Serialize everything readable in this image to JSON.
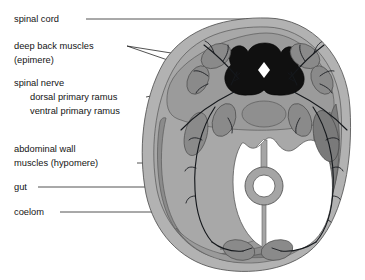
{
  "figure": {
    "background_color": "#ffffff",
    "width": 365,
    "height": 280
  },
  "labels": [
    {
      "id": "spinal-cord",
      "text": "spinal cord",
      "x": 14,
      "y": 22
    },
    {
      "id": "deep-back-muscles",
      "text": "deep back muscles",
      "x": 14,
      "y": 49
    },
    {
      "id": "epimere",
      "text": "(epimere)",
      "x": 14,
      "y": 63
    },
    {
      "id": "spinal-nerve",
      "text": "spinal nerve",
      "x": 14,
      "y": 86
    },
    {
      "id": "dorsal-primary-ramus",
      "text": "dorsal primary ramus",
      "x": 30,
      "y": 100
    },
    {
      "id": "ventral-primary-ramus",
      "text": "ventral primary ramus",
      "x": 30,
      "y": 114
    },
    {
      "id": "abdominal-wall-muscles",
      "text": "abdominal wall",
      "x": 14,
      "y": 152
    },
    {
      "id": "hypomere",
      "text": "muscles (hypomere)",
      "x": 14,
      "y": 166
    },
    {
      "id": "gut",
      "text": "gut",
      "x": 14,
      "y": 190
    },
    {
      "id": "coelom",
      "text": "coelom",
      "x": 14,
      "y": 215
    }
  ],
  "structures": {
    "body_wall": {
      "name": "outer body wall",
      "color": "#b2b2b2"
    },
    "somatic_layer": {
      "name": "somatic mesoderm layer",
      "color": "#a8a8a8"
    },
    "epimere_field": {
      "name": "dorsal epimere field",
      "color": "#9b9b9b"
    },
    "muscle_mass": {
      "name": "muscle bundle",
      "color": "#8a8a8a"
    },
    "hypomere_band": {
      "name": "hypomere muscle band",
      "color": "#7d7d7d"
    },
    "spinal_cord": {
      "name": "spinal cord",
      "color": "#101010"
    },
    "central_canal": {
      "name": "central canal",
      "color": "#ffffff"
    },
    "notochord": {
      "name": "notochord",
      "color": "#8f8f8f"
    },
    "aorta": {
      "name": "dorsal aorta",
      "color": "#ffffff"
    },
    "coelom": {
      "name": "coelom cavity",
      "color": "#ffffff"
    },
    "gut_wall": {
      "name": "gut wall",
      "color": "#a5a5a5"
    },
    "gut_lumen": {
      "name": "gut lumen",
      "color": "#ffffff"
    },
    "mesentery": {
      "name": "mesentery",
      "color": "#a5a5a5"
    },
    "nerve": {
      "name": "spinal nerve branches",
      "color": "#15181c"
    },
    "outline": {
      "name": "structure outline",
      "color": "#4a4a4a"
    },
    "leader_line": {
      "name": "label leader line",
      "color": "#1a1a1a"
    }
  }
}
